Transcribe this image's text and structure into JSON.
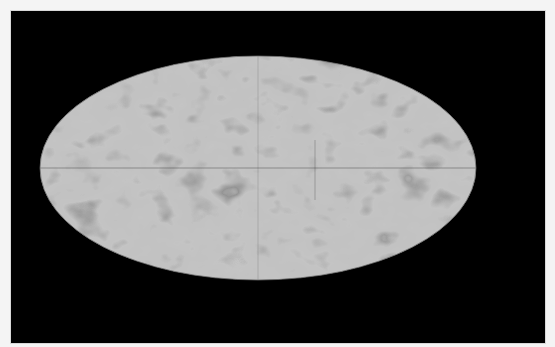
{
  "image": {
    "description": "Mollweide all-sky projection map, grayscale mottled texture",
    "projection": "mollweide",
    "colors": {
      "frame": "#f4f4f4",
      "background": "#000000",
      "map_base": "#8a8a8a",
      "map_dark": "#505050",
      "map_light": "#c8c8c8",
      "graticule": "#3a3a3a"
    },
    "ellipse": {
      "cx": 258,
      "cy": 168,
      "rx": 218,
      "ry": 112
    }
  }
}
